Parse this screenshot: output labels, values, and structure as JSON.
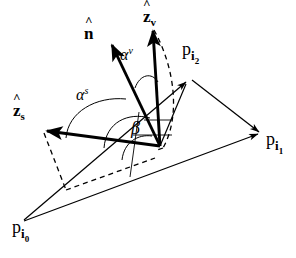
{
  "figure": {
    "background_color": "#ffffff",
    "stroke_color": "#000000",
    "width": 296,
    "height": 258
  },
  "labels": {
    "normal_vector": {
      "symbol": "n",
      "hat": "^",
      "subscript": ""
    },
    "view_vector": {
      "symbol": "z",
      "hat": "^",
      "subscript": "v"
    },
    "source_vector": {
      "symbol": "z",
      "hat": "^",
      "subscript": "s"
    },
    "alpha_view": {
      "symbol": "α",
      "superscript": "v"
    },
    "alpha_source": {
      "symbol": "α",
      "superscript": "s"
    },
    "beta": {
      "symbol": "β"
    },
    "point_0": {
      "symbol": "p",
      "sub1": "i",
      "sub2": "0"
    },
    "point_1": {
      "symbol": "p",
      "sub1": "i",
      "sub2": "1"
    },
    "point_2": {
      "symbol": "p",
      "sub1": "i",
      "sub2": "2"
    }
  },
  "geometry": {
    "vertex": {
      "x": 160,
      "y": 146
    },
    "triangle_vertices": {
      "p_i0": {
        "x": 22,
        "y": 222
      },
      "p_i1": {
        "x": 262,
        "y": 133
      },
      "p_i2": {
        "x": 190,
        "y": 78
      }
    },
    "vectors": [
      {
        "name": "n-hat",
        "from": {
          "x": 160,
          "y": 146
        },
        "to": {
          "x": 110,
          "y": 41
        }
      },
      {
        "name": "z-hat-v",
        "from": {
          "x": 160,
          "y": 146
        },
        "to": {
          "x": 152,
          "y": 27
        }
      },
      {
        "name": "z-hat-s",
        "from": {
          "x": 160,
          "y": 146
        },
        "to": {
          "x": 42,
          "y": 130
        }
      }
    ],
    "arcs": [
      {
        "name": "alpha-v-arc"
      },
      {
        "name": "alpha-s-arc"
      },
      {
        "name": "beta-arc"
      }
    ]
  }
}
